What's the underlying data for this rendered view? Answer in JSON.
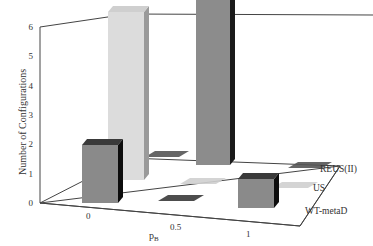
{
  "chart_data": {
    "type": "bar",
    "subtype": "3d-bar",
    "title": "",
    "xlabel": "pB",
    "ylabel": "Number of Configurations",
    "zlabel": "",
    "categories": [
      "0",
      "0.5",
      "1"
    ],
    "ylim": [
      0,
      6
    ],
    "yticks": [
      "0",
      "1",
      "2",
      "3",
      "4",
      "5",
      "6"
    ],
    "series": [
      {
        "name": "REUS(II)",
        "values": [
          0,
          6,
          0
        ],
        "color": "#8c8c8c",
        "side_color": "#1a1a1a",
        "top_color": "#555555"
      },
      {
        "name": "US",
        "values": [
          6,
          0,
          0
        ],
        "color": "#dcdcdc",
        "side_color": "#9a9a9a",
        "top_color": "#cfcfcf"
      },
      {
        "name": "WT-metaD",
        "values": [
          2,
          0,
          1
        ],
        "color": "#8a8a8a",
        "side_color": "#0d0d0d",
        "top_color": "#3a3a3a"
      }
    ],
    "grid": false,
    "legend_position": "depth-axis-right"
  },
  "labels": {
    "y_axis_title": "Number of Configurations",
    "x_axis_title_main": "p",
    "x_axis_title_sub": "B",
    "x_ticks": [
      "0",
      "0.5",
      "1"
    ],
    "y_ticks": [
      "0",
      "1",
      "2",
      "3",
      "4",
      "5",
      "6"
    ],
    "depth_labels": [
      "REUS(II)",
      "US",
      "WT-metaD"
    ]
  }
}
